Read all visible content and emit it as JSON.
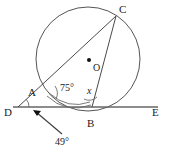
{
  "figure": {
    "type": "geometry-diagram",
    "background_color": "#ffffff",
    "stroke_color": "#555555",
    "label_color": "#222222"
  },
  "points": {
    "A": {
      "label": "A",
      "x": 44,
      "y": 92,
      "label_x": 31,
      "label_y": 95,
      "on_circle": true
    },
    "B": {
      "label": "B",
      "x": 92,
      "y": 107,
      "label_x": 88,
      "label_y": 123,
      "on_circle": true
    },
    "C": {
      "label": "C",
      "x": 116,
      "y": 16,
      "label_x": 119,
      "label_y": 12,
      "on_circle": true
    },
    "D": {
      "label": "D",
      "x": 18,
      "y": 107,
      "label_x": 7,
      "label_y": 114,
      "on_circle": false
    },
    "E": {
      "label": "E",
      "x": 155,
      "y": 107,
      "label_x": 155,
      "label_y": 114,
      "on_circle": false
    },
    "O": {
      "label": "O",
      "x": 89,
      "y": 60,
      "label_x": 94,
      "label_y": 70,
      "on_circle": false
    }
  },
  "circle": {
    "center_x": 88,
    "center_y": 59,
    "radius": 52
  },
  "segments": [
    {
      "name": "line-DE",
      "from": "D",
      "to": "E"
    },
    {
      "name": "chord-AC",
      "from": "A",
      "to": "C"
    },
    {
      "name": "chord-BC",
      "from": "B",
      "to": "C"
    },
    {
      "name": "segment-DA",
      "from": "D",
      "to": "A"
    }
  ],
  "angles": [
    {
      "name": "angle-at-A",
      "value": "75°",
      "vertex": "A",
      "label_x": 62,
      "label_y": 89
    },
    {
      "name": "angle-at-B",
      "value": "x",
      "vertex": "B",
      "label_x": 88,
      "label_y": 92
    },
    {
      "name": "angle-at-D",
      "value": "49°",
      "vertex": "D",
      "label_x": 56,
      "label_y": 142
    }
  ],
  "annotations": {
    "leader_arrow": {
      "name": "leader-to-angle-D",
      "from_x": 62,
      "from_y": 134,
      "to_x": 33,
      "to_y": 110
    }
  }
}
